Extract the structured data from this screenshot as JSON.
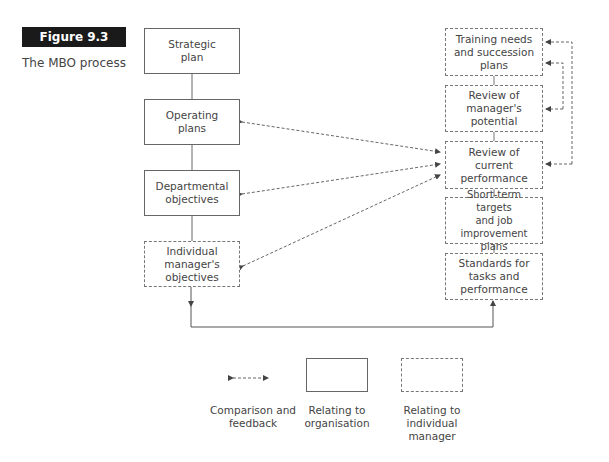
{
  "figure": {
    "label": "Figure 9.3",
    "caption": "The MBO process"
  },
  "left_column": [
    {
      "id": "strategic",
      "text": "Strategic\nplan",
      "style": "solid"
    },
    {
      "id": "operating",
      "text": "Operating\nplans",
      "style": "solid"
    },
    {
      "id": "departmental",
      "text": "Departmental\nobjectives",
      "style": "solid"
    },
    {
      "id": "individual",
      "text": "Individual\nmanager's\nobjectives",
      "style": "dashed"
    }
  ],
  "right_column": [
    {
      "id": "training",
      "text": "Training needs\nand succession\nplans",
      "style": "dashed"
    },
    {
      "id": "potential",
      "text": "Review of\nmanager's\npotential",
      "style": "dashed"
    },
    {
      "id": "current",
      "text": "Review of\ncurrent\nperformance",
      "style": "dashed"
    },
    {
      "id": "shortterm",
      "text": "Short-term targets\nand job\nimprovement plans",
      "style": "dashed"
    },
    {
      "id": "standards",
      "text": "Standards for\ntasks and\nperformance",
      "style": "dashed"
    }
  ],
  "legend": {
    "comparison": "Comparison and\nfeedback",
    "organisation": "Relating to\norganisation",
    "individual": "Relating to\nindividual\nmanager"
  },
  "colors": {
    "figure_label_bg": "#1a1a1a",
    "line": "#555555"
  }
}
